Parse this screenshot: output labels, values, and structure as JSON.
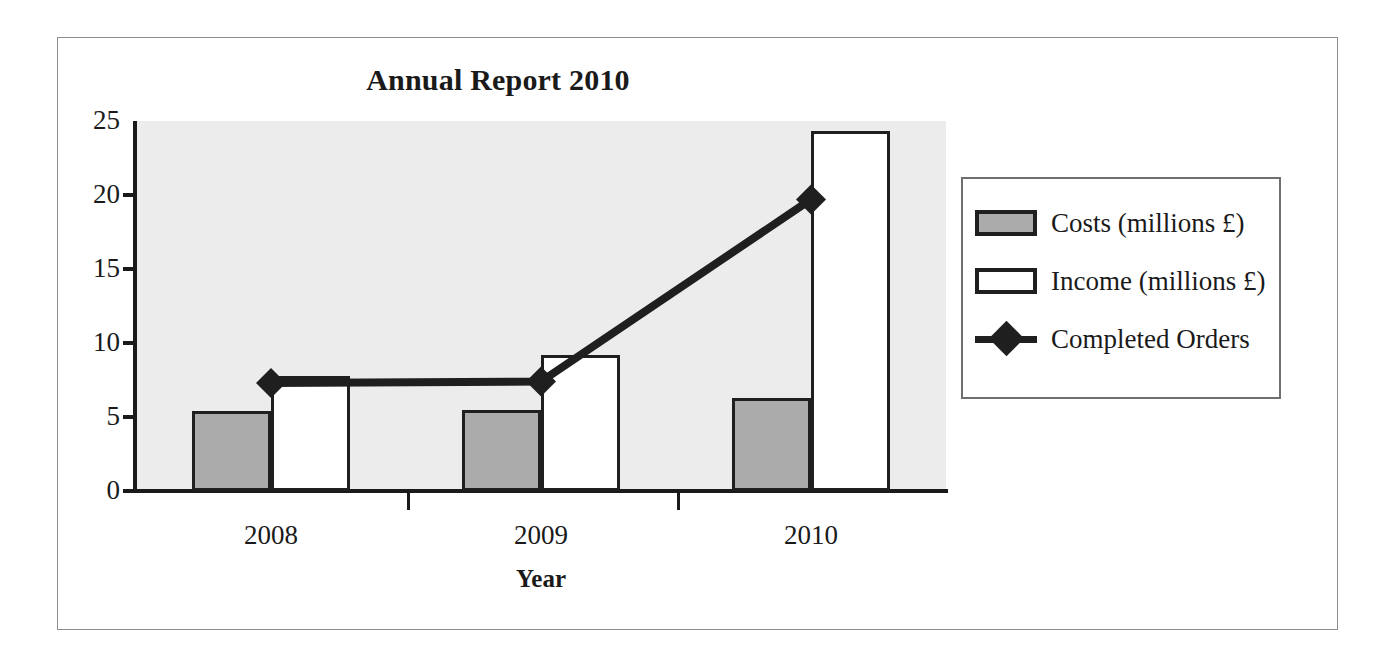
{
  "chart_data": {
    "type": "bar",
    "title": "Annual Report 2010",
    "xlabel": "Year",
    "ylabel": "",
    "categories": [
      "2008",
      "2009",
      "2010"
    ],
    "ylim": [
      0,
      25
    ],
    "yticks": [
      0,
      5,
      10,
      15,
      20,
      25
    ],
    "ytick_labels": [
      "0",
      "5",
      "10",
      "15",
      "20",
      "25"
    ],
    "grid": false,
    "legend_position": "right",
    "plot_background": "#ececec",
    "series": [
      {
        "name": "Costs (millions £)",
        "type": "bar",
        "values": [
          5.4,
          5.5,
          6.3
        ],
        "fill": "#ababab",
        "stroke": "#1f1f1f"
      },
      {
        "name": "Income (millions £)",
        "type": "bar",
        "values": [
          7.8,
          9.2,
          24.3
        ],
        "fill": "#ffffff",
        "stroke": "#1f1f1f"
      },
      {
        "name": "Completed Orders",
        "type": "line",
        "values": [
          7.3,
          7.4,
          19.7
        ],
        "marker": "diamond",
        "stroke": "#1f1f1f"
      }
    ]
  },
  "legend": {
    "items": [
      {
        "label": "Costs (millions £)",
        "swatch": "filled-gray-square"
      },
      {
        "label": "Income (millions £)",
        "swatch": "outlined-white-square"
      },
      {
        "label": "Completed Orders",
        "swatch": "line-with-diamond-marker"
      }
    ]
  },
  "axis": {
    "y_labels": [
      "25",
      "20",
      "15",
      "10",
      "5",
      "0"
    ],
    "x_labels": [
      "2008",
      "2009",
      "2010"
    ],
    "x_title": "Year"
  }
}
